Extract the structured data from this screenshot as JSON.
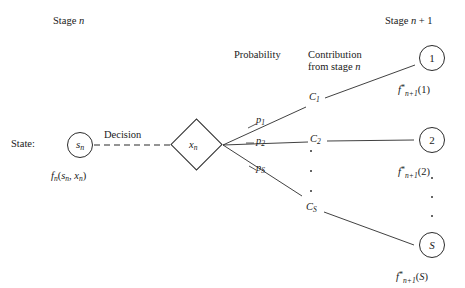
{
  "figure": {
    "title_left": "Stage n",
    "title_right": "Stage n + 1",
    "column_headers": {
      "probability": "Probability",
      "contribution_line1": "Contribution",
      "contribution_line2": "from stage n"
    },
    "state_label": "State:",
    "decision_label": "Decision",
    "state_node": {
      "symbol_base": "s",
      "symbol_sub": "n",
      "value_label": "fn(sn, xn)"
    },
    "decision_node": {
      "symbol_base": "x",
      "symbol_sub": "n"
    },
    "branches": [
      {
        "probability_base": "p",
        "probability_sub": "1",
        "contribution_base": "C",
        "contribution_sub": "1",
        "node_label": "1",
        "value_base": "f",
        "value_sub": "n+1",
        "value_arg": "(1)"
      },
      {
        "probability_base": "p",
        "probability_sub": "2",
        "contribution_base": "C",
        "contribution_sub": "2",
        "node_label": "2",
        "value_base": "f",
        "value_sub": "n+1",
        "value_arg": "(2)"
      },
      {
        "probability_base": "p",
        "probability_sub": "S",
        "contribution_base": "C",
        "contribution_sub": "S",
        "node_label": "S",
        "value_base": "f",
        "value_sub": "n+1",
        "value_arg": "(S)"
      }
    ],
    "ellipsis": {
      "middle": "vertical-dots",
      "right": "vertical-dots"
    },
    "colors": {
      "background": "#ffffff",
      "stroke": "#2b2b2b",
      "text": "#1a1a1a"
    }
  }
}
